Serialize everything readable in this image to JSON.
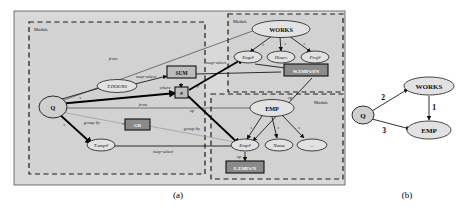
{
  "figure": {
    "captions": [
      {
        "id": "caption-a",
        "label": "(a)"
      },
      {
        "id": "caption-b",
        "label": "(b)"
      }
    ]
  },
  "panel_a": {
    "modules": [
      {
        "id": "module-query",
        "label": "Module"
      },
      {
        "id": "module-works",
        "label": "Module"
      },
      {
        "id": "module-emp",
        "label": "Module"
      }
    ],
    "nodes": {
      "query": "Q",
      "t_hours": "T.HOURS",
      "t_empno": "T.emp#",
      "works": "WORKS",
      "works_empno": "Emp#",
      "works_hours": "Hours",
      "works_projno": "Proj#",
      "emp": "EMP",
      "emp_empno": "Emp#",
      "emp_name": "Name",
      "emp_etc": "..."
    },
    "boxes": {
      "sum": "SUM",
      "gb": "GB",
      "op_where": "σ",
      "works_map": "W.EMP#/PN",
      "emp_map": "E.EMP#/N"
    },
    "edge_labels": {
      "from_1": "from",
      "from_2": "from",
      "map_select_1": "map-select",
      "map_select_2": "map-select",
      "map_select_3": "map-select",
      "where": "where",
      "group_by_1": "group by",
      "group_by_2": "group by",
      "op_1": "op",
      "op_2": "op",
      "op_3": "op",
      "op_4": "op",
      "s_q1": "s",
      "s_q2": "s",
      "s_w1": "s",
      "s_w2": "s",
      "s_w3": "s",
      "s_e1": "s",
      "s_e2": "s",
      "s_e3": "s"
    }
  },
  "panel_b": {
    "nodes": {
      "query": "Q",
      "works": "WORKS",
      "emp": "EMP"
    },
    "edge_labels": {
      "q_works": "2",
      "q_emp": "3",
      "works_emp": "1"
    }
  },
  "colors": {
    "panel_background": "#d9d9d9",
    "module_fill": "#d2d2d2",
    "node_fill": "#e2e2e2",
    "box_fill": "#bdbdbd",
    "box_dark_fill": "#8a8a8a",
    "stroke": "#1a1a1a"
  }
}
